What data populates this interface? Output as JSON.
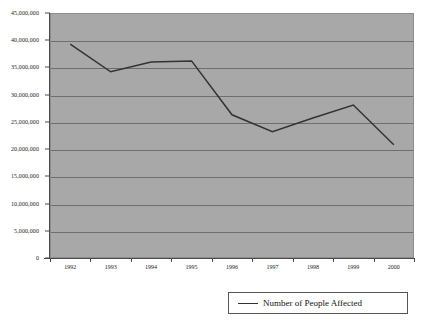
{
  "chart_data": {
    "type": "line",
    "title": "",
    "xlabel": "",
    "ylabel": "",
    "categories": [
      "1992",
      "1993",
      "1994",
      "1995",
      "1996",
      "1997",
      "1998",
      "1999",
      "2000"
    ],
    "series": [
      {
        "name": "Number of People Affected",
        "values": [
          39300000,
          34200000,
          36000000,
          36200000,
          26300000,
          23200000,
          25700000,
          28100000,
          20800000
        ],
        "color": "#333333"
      }
    ],
    "ylim": [
      0,
      45000000
    ],
    "ytick_step": 5000000,
    "ytick_labels": [
      "45,000,000",
      "40,000,000",
      "35,000,000",
      "30,000,000",
      "25,000,000",
      "20,000,000",
      "15,000,000",
      "10,000,000",
      "5,000,000",
      "0"
    ],
    "ytick_values": [
      45000000,
      40000000,
      35000000,
      30000000,
      25000000,
      20000000,
      15000000,
      10000000,
      5000000,
      0
    ],
    "grid": true,
    "plot_background": "#a8a8a8",
    "gridline_color": "#6e6e6e",
    "legend": {
      "position": "bottom-right",
      "entries": [
        {
          "label": "Number of People Affected",
          "color": "#333333"
        }
      ]
    }
  }
}
